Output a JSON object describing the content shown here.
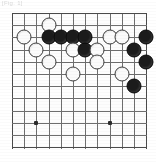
{
  "caption": {
    "text": "[Fig. 1]"
  },
  "board": {
    "kind": "go-board-diagram",
    "label": "Go board corner diagram",
    "columns": 12,
    "rows": 12,
    "cell_size_px": 12.2,
    "origin_px": {
      "x": 12,
      "y": 13
    },
    "colors": {
      "grid": "#6e6e6e",
      "edge": "#4a4a4a",
      "board_background": "#fdfdfd",
      "black_stone": "#1b1b1b",
      "white_stone": "#fbfbfb",
      "white_stone_outline": "#3a3a3a",
      "hoshi": "#2b2b2b"
    },
    "hoshi_points": [
      {
        "col": 2,
        "row": 9
      },
      {
        "col": 8,
        "row": 9
      }
    ],
    "stones": [
      {
        "color": "white",
        "col": 3,
        "row": 1
      },
      {
        "color": "white",
        "col": 1,
        "row": 2
      },
      {
        "color": "black",
        "col": 3,
        "row": 2
      },
      {
        "color": "black",
        "col": 4,
        "row": 2
      },
      {
        "color": "black",
        "col": 5,
        "row": 2
      },
      {
        "color": "black",
        "col": 6,
        "row": 2
      },
      {
        "color": "white",
        "col": 8,
        "row": 2
      },
      {
        "color": "white",
        "col": 9,
        "row": 2
      },
      {
        "color": "black",
        "col": 11,
        "row": 2
      },
      {
        "color": "white",
        "col": 2,
        "row": 3
      },
      {
        "color": "white",
        "col": 5,
        "row": 3
      },
      {
        "color": "black",
        "col": 6,
        "row": 3
      },
      {
        "color": "white",
        "col": 7,
        "row": 3
      },
      {
        "color": "black",
        "col": 10,
        "row": 3
      },
      {
        "color": "white",
        "col": 3,
        "row": 4
      },
      {
        "color": "white",
        "col": 7,
        "row": 4
      },
      {
        "color": "black",
        "col": 11,
        "row": 4
      },
      {
        "color": "white",
        "col": 5,
        "row": 5
      },
      {
        "color": "white",
        "col": 9,
        "row": 5
      },
      {
        "color": "black",
        "col": 10,
        "row": 6
      }
    ],
    "counts": {
      "black": 9,
      "white": 11,
      "total": 20
    }
  }
}
